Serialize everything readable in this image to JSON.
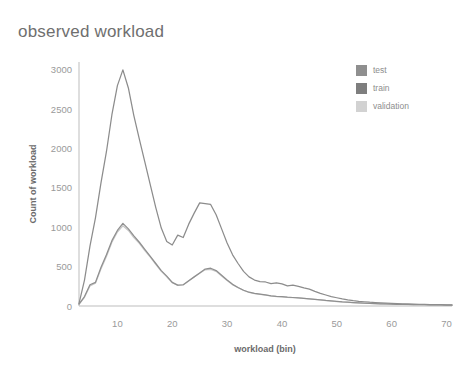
{
  "chart_data": {
    "type": "line",
    "title": "observed workload",
    "xlabel": "workload (bin)",
    "ylabel": "Count of workload",
    "xlim": [
      3,
      71
    ],
    "ylim": [
      0,
      3100
    ],
    "grid": false,
    "legend_position": "top-right",
    "xticks": [
      10,
      20,
      30,
      40,
      50,
      60,
      70
    ],
    "yticks": [
      0,
      500,
      1000,
      1500,
      2000,
      2500,
      3000
    ],
    "x": [
      3,
      4,
      5,
      6,
      7,
      8,
      9,
      10,
      11,
      12,
      13,
      14,
      15,
      16,
      17,
      18,
      19,
      20,
      21,
      22,
      23,
      24,
      25,
      26,
      27,
      28,
      29,
      30,
      31,
      32,
      33,
      34,
      35,
      36,
      37,
      38,
      39,
      40,
      41,
      42,
      43,
      44,
      45,
      46,
      47,
      48,
      49,
      50,
      51,
      52,
      53,
      54,
      55,
      56,
      57,
      58,
      59,
      60,
      61,
      62,
      63,
      64,
      65,
      66,
      67,
      68,
      69,
      70,
      71
    ],
    "series": [
      {
        "name": "train",
        "color": "#8c8c8c",
        "values": [
          30,
          330,
          760,
          1120,
          1560,
          1960,
          2430,
          2800,
          3000,
          2770,
          2420,
          2120,
          1830,
          1540,
          1250,
          990,
          820,
          775,
          900,
          870,
          1040,
          1180,
          1310,
          1300,
          1290,
          1160,
          980,
          800,
          650,
          540,
          440,
          370,
          330,
          310,
          305,
          285,
          295,
          280,
          255,
          265,
          250,
          230,
          215,
          185,
          160,
          140,
          120,
          105,
          90,
          78,
          68,
          60,
          54,
          48,
          44,
          40,
          36,
          33,
          30,
          28,
          26,
          24,
          22,
          20,
          18,
          17,
          16,
          15,
          14
        ]
      },
      {
        "name": "test",
        "color": "#8f8f8f",
        "values": [
          25,
          120,
          270,
          300,
          490,
          650,
          830,
          960,
          1050,
          980,
          890,
          810,
          720,
          630,
          540,
          450,
          380,
          300,
          265,
          270,
          320,
          370,
          420,
          470,
          480,
          450,
          390,
          330,
          275,
          235,
          200,
          175,
          160,
          150,
          140,
          130,
          122,
          118,
          112,
          108,
          104,
          98,
          92,
          85,
          78,
          70,
          64,
          58,
          52,
          48,
          44,
          40,
          36,
          33,
          30,
          28,
          26,
          24,
          22,
          20,
          19,
          18,
          17,
          16,
          15,
          14,
          13,
          12,
          11
        ]
      },
      {
        "name": "validation",
        "color": "#c8c8c8",
        "values": [
          22,
          110,
          255,
          290,
          470,
          630,
          810,
          940,
          1020,
          960,
          870,
          795,
          705,
          620,
          530,
          440,
          372,
          295,
          262,
          268,
          318,
          368,
          415,
          460,
          465,
          440,
          382,
          324,
          270,
          232,
          198,
          173,
          158,
          148,
          138,
          128,
          120,
          116,
          110,
          106,
          102,
          96,
          90,
          84,
          77,
          69,
          63,
          57,
          51,
          47,
          43,
          39,
          35,
          32,
          29,
          27,
          25,
          23,
          21,
          19,
          18,
          17,
          16,
          15,
          14,
          13,
          12,
          11,
          10
        ]
      }
    ],
    "legend": [
      {
        "label": "test",
        "color": "#8f8f8f"
      },
      {
        "label": "train",
        "color": "#7e7e7e"
      },
      {
        "label": "validation",
        "color": "#d2d2d2"
      }
    ]
  },
  "axes": {
    "axis_line_color": "#b8b8b8",
    "tick_color": "#9a9a9a"
  }
}
